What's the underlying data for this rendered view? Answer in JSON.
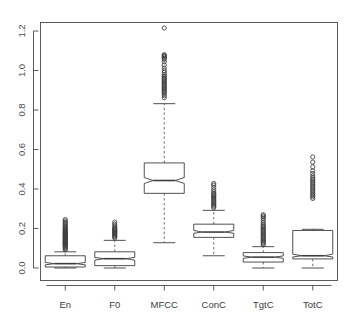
{
  "chart_data": {
    "type": "boxplot",
    "title": "",
    "xlabel": "",
    "ylabel": "",
    "ylim": [
      -0.035,
      1.285
    ],
    "yticks": [
      0.0,
      0.2,
      0.4,
      0.6,
      0.8,
      1.0,
      1.2
    ],
    "ytick_labels": [
      "0.0",
      "0.2",
      "0.4",
      "0.6",
      "0.8",
      "1.0",
      "1.2"
    ],
    "categories": [
      "En",
      "F0",
      "MFCC",
      "ConC",
      "TgtC",
      "TotC"
    ],
    "grid": false,
    "legend": null,
    "notched": true,
    "frame": true,
    "boxes": [
      {
        "name": "En",
        "whisker_low": 0.0,
        "q1": 0.005,
        "median": 0.022,
        "q3": 0.062,
        "whisker_high": 0.082,
        "notch_low": 0.016,
        "notch_high": 0.028,
        "outliers": [
          0.092,
          0.098,
          0.103,
          0.108,
          0.112,
          0.116,
          0.119,
          0.122,
          0.125,
          0.128,
          0.131,
          0.134,
          0.137,
          0.14,
          0.143,
          0.146,
          0.149,
          0.152,
          0.155,
          0.158,
          0.161,
          0.164,
          0.167,
          0.17,
          0.173,
          0.176,
          0.179,
          0.182,
          0.186,
          0.19,
          0.194,
          0.198,
          0.202,
          0.207,
          0.212,
          0.218,
          0.224,
          0.231,
          0.238,
          0.245
        ]
      },
      {
        "name": "F0",
        "whisker_low": 0.0,
        "q1": 0.012,
        "median": 0.047,
        "q3": 0.082,
        "whisker_high": 0.14,
        "notch_low": 0.04,
        "notch_high": 0.054,
        "outliers": [
          0.152,
          0.158,
          0.163,
          0.168,
          0.172,
          0.176,
          0.18,
          0.184,
          0.188,
          0.192,
          0.196,
          0.2,
          0.206,
          0.213,
          0.222,
          0.232
        ]
      },
      {
        "name": "MFCC",
        "whisker_low": 0.128,
        "q1": 0.378,
        "median": 0.443,
        "q3": 0.532,
        "whisker_high": 0.832,
        "notch_low": 0.428,
        "notch_high": 0.458,
        "outliers": [
          0.862,
          0.872,
          0.88,
          0.888,
          0.894,
          0.9,
          0.906,
          0.912,
          0.918,
          0.924,
          0.93,
          0.936,
          0.942,
          0.948,
          0.954,
          0.96,
          0.966,
          0.972,
          0.98,
          0.99,
          1.0,
          1.012,
          1.028,
          1.044,
          1.056,
          1.062,
          1.068,
          1.072,
          1.076,
          1.08,
          1.215
        ]
      },
      {
        "name": "ConC",
        "whisker_low": 0.062,
        "q1": 0.155,
        "median": 0.182,
        "q3": 0.222,
        "whisker_high": 0.292,
        "notch_low": 0.176,
        "notch_high": 0.19,
        "outliers": [
          0.305,
          0.312,
          0.318,
          0.324,
          0.33,
          0.336,
          0.342,
          0.348,
          0.354,
          0.36,
          0.366,
          0.372,
          0.378,
          0.386,
          0.396,
          0.408,
          0.42,
          0.428
        ]
      },
      {
        "name": "TgtC",
        "whisker_low": 0.0,
        "q1": 0.03,
        "median": 0.055,
        "q3": 0.078,
        "whisker_high": 0.108,
        "notch_low": 0.049,
        "notch_high": 0.061,
        "outliers": [
          0.118,
          0.124,
          0.13,
          0.136,
          0.142,
          0.148,
          0.154,
          0.16,
          0.166,
          0.172,
          0.178,
          0.184,
          0.19,
          0.196,
          0.202,
          0.208,
          0.214,
          0.222,
          0.23,
          0.24,
          0.25,
          0.258,
          0.264,
          0.27
        ]
      },
      {
        "name": "TotC",
        "whisker_low": 0.0,
        "q1": 0.046,
        "median": 0.062,
        "q3": 0.19,
        "whisker_high": 0.196,
        "notch_low": 0.056,
        "notch_high": 0.07,
        "outliers": [
          0.352,
          0.36,
          0.368,
          0.376,
          0.384,
          0.392,
          0.4,
          0.408,
          0.416,
          0.424,
          0.432,
          0.44,
          0.448,
          0.456,
          0.466,
          0.478,
          0.492,
          0.512,
          0.536,
          0.562
        ]
      }
    ],
    "colors": {
      "line": "#3d3d3d",
      "axis": "#4a4a4a",
      "outlier_stroke": "#3d3d3d",
      "background": "#ffffff",
      "whisker_dash": "#5a5a5a"
    }
  }
}
